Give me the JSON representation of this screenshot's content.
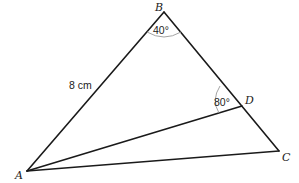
{
  "diagram": {
    "type": "triangle",
    "vertices": {
      "A": {
        "label": "A",
        "x": 27,
        "y": 171
      },
      "B": {
        "label": "B",
        "x": 164,
        "y": 12
      },
      "C": {
        "label": "C",
        "x": 279,
        "y": 151
      },
      "D": {
        "label": "D",
        "x": 242,
        "y": 106
      }
    },
    "segments": [
      {
        "from": "A",
        "to": "B"
      },
      {
        "from": "B",
        "to": "C"
      },
      {
        "from": "A",
        "to": "C"
      },
      {
        "from": "A",
        "to": "D"
      }
    ],
    "labels": {
      "side_ab": "8 cm",
      "angle_b": "40°",
      "angle_adb": "80°"
    }
  }
}
